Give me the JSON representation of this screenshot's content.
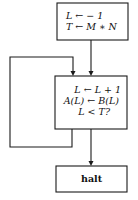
{
  "diagram": {
    "type": "flowchart",
    "nodes": [
      {
        "id": "init",
        "lines": [
          "L ← − 1",
          "T ← M ∗ N"
        ]
      },
      {
        "id": "loop_body",
        "lines": [
          "L ← L + 1",
          "A(L) ← B(L)",
          "L < T?"
        ]
      },
      {
        "id": "halt",
        "lines": [
          "halt"
        ]
      }
    ],
    "edges": [
      {
        "from": "init",
        "to": "loop_body"
      },
      {
        "from": "loop_body",
        "to": "loop_body",
        "label": ""
      },
      {
        "from": "loop_body",
        "to": "halt"
      }
    ]
  },
  "colors": {
    "stroke": "#1a1a1a",
    "background": "#ffffff",
    "text": "#111111"
  }
}
